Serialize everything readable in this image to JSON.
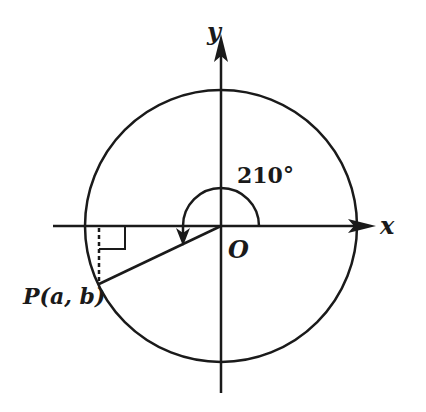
{
  "diagram": {
    "type": "unit-circle-angle",
    "labels": {
      "x_axis": "x",
      "y_axis": "y",
      "origin": "O",
      "angle": "210°",
      "point": "P(a, b)"
    },
    "angle_degrees": 210,
    "colors": {
      "stroke": "#1a1a1a",
      "background": "#ffffff"
    }
  }
}
